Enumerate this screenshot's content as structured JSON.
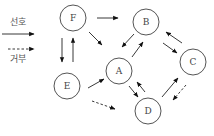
{
  "legend": {
    "items": [
      {
        "label": "선호",
        "style": "solid",
        "y_text": 22,
        "y_line": 34
      },
      {
        "label": "거부",
        "style": "dashed",
        "y_line": 50,
        "y_text": 61
      }
    ]
  },
  "nodes": [
    {
      "id": "F",
      "label": "F",
      "cx": 73,
      "cy": 18
    },
    {
      "id": "B",
      "label": "B",
      "cx": 146,
      "cy": 22
    },
    {
      "id": "C",
      "label": "C",
      "cx": 193,
      "cy": 62
    },
    {
      "id": "A",
      "label": "A",
      "cx": 119,
      "cy": 71
    },
    {
      "id": "E",
      "label": "E",
      "cx": 67,
      "cy": 86
    },
    {
      "id": "D",
      "label": "D",
      "cx": 148,
      "cy": 111
    }
  ],
  "node_radius": 13,
  "edges": [
    {
      "from": "F",
      "to": "B",
      "style": "solid",
      "x1": 97,
      "y1": 18,
      "x2": 118,
      "y2": 18
    },
    {
      "from": "F",
      "to": "A",
      "style": "solid",
      "x1": 89,
      "y1": 32,
      "x2": 102,
      "y2": 45
    },
    {
      "from": "F",
      "to": "E",
      "style": "solid",
      "x1": 62,
      "y1": 38,
      "x2": 62,
      "y2": 62
    },
    {
      "from": "E",
      "to": "F",
      "style": "solid",
      "x1": 73,
      "y1": 62,
      "x2": 73,
      "y2": 38
    },
    {
      "from": "B",
      "to": "A",
      "style": "solid",
      "x1": 134,
      "y1": 34,
      "x2": 122,
      "y2": 47
    },
    {
      "from": "A",
      "to": "B",
      "style": "solid",
      "x1": 132,
      "y1": 57,
      "x2": 143,
      "y2": 42
    },
    {
      "from": "C",
      "to": "B",
      "style": "solid",
      "x1": 182,
      "y1": 43,
      "x2": 166,
      "y2": 32
    },
    {
      "from": "B",
      "to": "C",
      "style": "solid",
      "x1": 163,
      "y1": 43,
      "x2": 177,
      "y2": 53
    },
    {
      "from": "E",
      "to": "A",
      "style": "solid",
      "x1": 88,
      "y1": 88,
      "x2": 104,
      "y2": 79
    },
    {
      "from": "E",
      "to": "D",
      "style": "dashed",
      "x1": 92,
      "y1": 101,
      "x2": 115,
      "y2": 109
    },
    {
      "from": "A",
      "to": "D",
      "style": "solid",
      "x1": 129,
      "y1": 86,
      "x2": 138,
      "y2": 97
    },
    {
      "from": "D",
      "to": "A",
      "style": "solid",
      "x1": 145,
      "y1": 92,
      "x2": 137,
      "y2": 82
    },
    {
      "from": "D",
      "to": "C",
      "style": "solid",
      "x1": 162,
      "y1": 97,
      "x2": 178,
      "y2": 78
    },
    {
      "from": "C",
      "to": "D",
      "style": "dashed",
      "x1": 186,
      "y1": 85,
      "x2": 173,
      "y2": 100
    }
  ]
}
